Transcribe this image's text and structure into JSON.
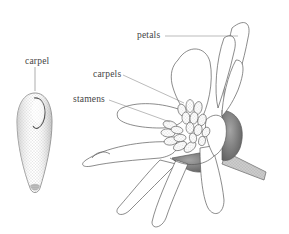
{
  "figure": {
    "labels": {
      "carpel": "carpel",
      "petals": "petals",
      "carpels": "carpels",
      "stamens": "stamens"
    },
    "colors": {
      "line": "#555555",
      "stipple": "#8a8a8a",
      "dark_shade": "#6e6e6e",
      "background": "#ffffff"
    }
  }
}
